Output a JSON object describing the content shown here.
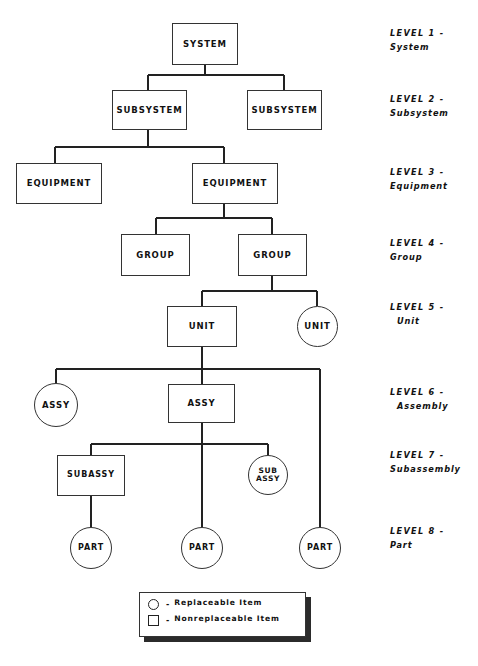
{
  "diagram": {
    "nodes": [
      {
        "id": "system",
        "label": "SYSTEM",
        "shape": "box",
        "level": 1
      },
      {
        "id": "subsystem1",
        "label": "SUBSYSTEM",
        "shape": "box",
        "level": 2
      },
      {
        "id": "subsystem2",
        "label": "SUBSYSTEM",
        "shape": "box",
        "level": 2
      },
      {
        "id": "equipment1",
        "label": "EQUIPMENT",
        "shape": "box",
        "level": 3
      },
      {
        "id": "equipment2",
        "label": "EQUIPMENT",
        "shape": "box",
        "level": 3
      },
      {
        "id": "group1",
        "label": "GROUP",
        "shape": "box",
        "level": 4
      },
      {
        "id": "group2",
        "label": "GROUP",
        "shape": "box",
        "level": 4
      },
      {
        "id": "unit1",
        "label": "UNIT",
        "shape": "box",
        "level": 5
      },
      {
        "id": "unit2",
        "label": "UNIT",
        "shape": "circle",
        "level": 5
      },
      {
        "id": "assy1",
        "label": "ASSY",
        "shape": "circle",
        "level": 6
      },
      {
        "id": "assy2",
        "label": "ASSY",
        "shape": "box",
        "level": 6
      },
      {
        "id": "subassy1",
        "label": "SUBASSY",
        "shape": "box",
        "level": 7
      },
      {
        "id": "subassy2",
        "label": "SUB ASSY",
        "shape": "circle",
        "level": 7
      },
      {
        "id": "part1",
        "label": "PART",
        "shape": "circle",
        "level": 8
      },
      {
        "id": "part2",
        "label": "PART",
        "shape": "circle",
        "level": 8
      },
      {
        "id": "part3",
        "label": "PART",
        "shape": "circle",
        "level": 8
      }
    ]
  },
  "levels": [
    {
      "heading": "LEVEL 1 -",
      "name": "System"
    },
    {
      "heading": "LEVEL 2 -",
      "name": "Subsystem"
    },
    {
      "heading": "LEVEL 3 -",
      "name": "Equipment"
    },
    {
      "heading": "LEVEL 4 -",
      "name": "Group"
    },
    {
      "heading": "LEVEL 5 -",
      "name": "Unit"
    },
    {
      "heading": "LEVEL 6 -",
      "name": "Assembly"
    },
    {
      "heading": "LEVEL 7 -",
      "name": "Subassembly"
    },
    {
      "heading": "LEVEL 8 -",
      "name": "Part"
    }
  ],
  "legend": {
    "items": [
      {
        "shape": "circle",
        "dash": "-",
        "text": "Replaceable Item"
      },
      {
        "shape": "square",
        "dash": "-",
        "text": "Nonreplaceable Item"
      }
    ]
  },
  "colors": {
    "ink": "#111111",
    "line": "#222222",
    "paper": "#ffffff",
    "shadow": "#2b2b2b"
  }
}
